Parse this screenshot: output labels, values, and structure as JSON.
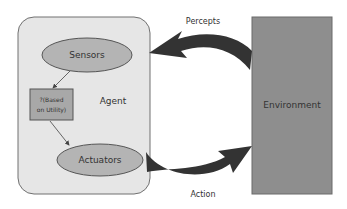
{
  "diagram": {
    "agent": {
      "label": "Agent",
      "sensors_label": "Sensors",
      "actuators_label": "Actuators",
      "decision_box_line1": "?(Based",
      "decision_box_line2": "on Utility)"
    },
    "environment": {
      "label": "Environment"
    },
    "arrows": {
      "percepts_label": "Percepts",
      "action_label": "Action"
    },
    "colors": {
      "agent_fill": "#e6e6e6",
      "agent_stroke": "#707070",
      "ellipse_fill": "#b4b4b4",
      "box_fill": "#a8a8a8",
      "environment_fill": "#8e8e8e",
      "arrow_fill": "#333333"
    }
  }
}
